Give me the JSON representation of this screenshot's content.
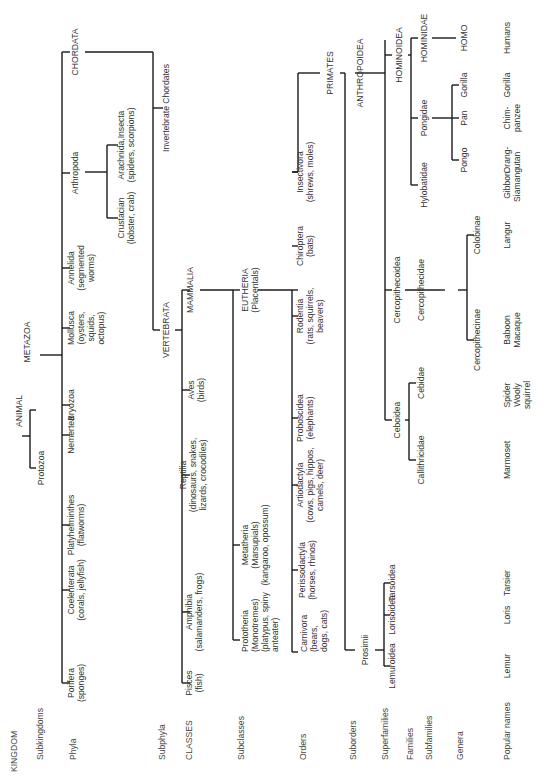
{
  "diagram": {
    "orientation": "rotated 90 degrees counter-clockwise",
    "ranks": [
      {
        "id": "kingdom",
        "label": "KINGDOM"
      },
      {
        "id": "subkingdoms",
        "label": "Subkingdoms"
      },
      {
        "id": "phyla",
        "label": "Phyla"
      },
      {
        "id": "subphyla",
        "label": "Subphyla"
      },
      {
        "id": "classes",
        "label": "CLASSES"
      },
      {
        "id": "subclasses",
        "label": "Subclasses"
      },
      {
        "id": "orders",
        "label": "Orders"
      },
      {
        "id": "suborders",
        "label": "Suborders"
      },
      {
        "id": "superfamilies",
        "label": "Superfamilies"
      },
      {
        "id": "families",
        "label": "Families"
      },
      {
        "id": "subfamilies",
        "label": "Subfamilies"
      },
      {
        "id": "genera",
        "label": "Genera"
      },
      {
        "id": "popular_names",
        "label": "Popular names"
      }
    ],
    "nodes": {
      "animal": [
        "ANIMAL"
      ],
      "protozoa": [
        "Protozoa"
      ],
      "metazoa": [
        "METAZOA"
      ],
      "porifera": [
        "Porifera",
        "(sponges)"
      ],
      "coelenterata": [
        "Coelenterata",
        "(corals, jellyfish)"
      ],
      "platyhelminthes": [
        "Platyhelminthes",
        "(flatworms)"
      ],
      "nemertea": [
        "Nemertea"
      ],
      "bryozoa": [
        "Bryozoa"
      ],
      "mollusca": [
        "Mollusca",
        "(oysters,",
        "squids,",
        "octopus)"
      ],
      "annelida": [
        "Annelida",
        "(segmented",
        "worms)"
      ],
      "arthropoda": [
        "Arthropoda"
      ],
      "crustacian": [
        "Crustacian",
        "(lobster, crab)"
      ],
      "arachnida": [
        "Arachnida,Insecta",
        "(spiders, scorpions)"
      ],
      "chordata": [
        "CHORDATA"
      ],
      "invertebrate_chordates": [
        "Invertebrate Chordates"
      ],
      "vertebrata": [
        "VERTEBRATA"
      ],
      "pisces": [
        "Pisces",
        "(fish)"
      ],
      "amphibia": [
        "Amphibia",
        "(salamanders, frogs)"
      ],
      "reptilia": [
        "Reptilia",
        "(dinosaurs, snakes,",
        "lizards, crocodiles)"
      ],
      "aves": [
        "Aves",
        "(birds)"
      ],
      "mammalia": [
        "MAMMALIA"
      ],
      "prototheria": [
        "Prototheria",
        "(Monotremes)",
        "(platypus, spiny",
        "anteater)"
      ],
      "metatheria": [
        "Metatheria",
        "(Marsupials)",
        "(kangaroo, opossum)"
      ],
      "eutheria": [
        "EUTHERIA",
        "(Placentals)"
      ],
      "carnivora": [
        "Carnivora",
        "(bears,",
        "dogs, cats)"
      ],
      "perissodactyla": [
        "Perissodactyla",
        "(horses, rhinos)"
      ],
      "artiodactyla": [
        "Artiodactyla",
        "(cows, pigs, hippos,",
        "camels, deer)"
      ],
      "proboscidea": [
        "Proboscidea",
        "(elephants)"
      ],
      "rodentia": [
        "Rodentia",
        "(rats, squirrels,",
        "beavers)"
      ],
      "chiroptera": [
        "Chiroptera",
        "(bats)"
      ],
      "insectivora": [
        "Insectivora",
        "(shrews, moles)"
      ],
      "primates": [
        "PRIMATES"
      ],
      "prosimii": [
        "Prosimii"
      ],
      "anthropoidea": [
        "ANTHROPOIDEA"
      ],
      "lemuroidea": [
        "Lemuroidea"
      ],
      "lorisoidea": [
        "Lorisoidea"
      ],
      "tarsoidea": [
        "Tarsoidea"
      ],
      "ceboidea": [
        "Ceboidea"
      ],
      "cercopithecoidea": [
        "Cercopithecoidea"
      ],
      "hominoidea": [
        "HOMINOIDEA"
      ],
      "callithricidae": [
        "Callithricidae"
      ],
      "cebidae": [
        "Cebidae"
      ],
      "cercopithecidae": [
        "Cercopithecidae"
      ],
      "hylobatidae": [
        "Hylobatidae"
      ],
      "pongidae": [
        "Pongidae"
      ],
      "hominidae": [
        "HOMINIDAE"
      ],
      "cercopithecinae": [
        "Cercopithecinae"
      ],
      "colobinae": [
        "Colobinae"
      ],
      "pongo": [
        "Pongo"
      ],
      "pan": [
        "Pan"
      ],
      "gorilla": [
        "Gorilla"
      ],
      "homo": [
        "HOMO"
      ]
    },
    "popular_names": [
      [
        "Lemur"
      ],
      [
        "Loris"
      ],
      [
        "Tarsier"
      ],
      [
        "Marmoset"
      ],
      [
        "Spider",
        "Wooly",
        "squirrel"
      ],
      [
        "Baboon",
        "Macaque"
      ],
      [
        "Langur"
      ],
      [
        "Gibbon",
        "Siamang"
      ],
      [
        "Orang-",
        "utan"
      ],
      [
        "Chim-",
        "panzee"
      ],
      [
        "Gorilla"
      ],
      [
        "Humans"
      ]
    ]
  }
}
